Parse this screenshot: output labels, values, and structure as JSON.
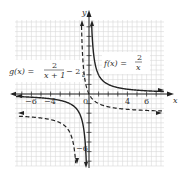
{
  "chart_data": {
    "type": "line",
    "title": "",
    "xlabel": "x",
    "ylabel": "y",
    "xlim": [
      -7.5,
      8
    ],
    "ylim": [
      -7.5,
      8
    ],
    "grid": true,
    "x_tick_labels": [
      "-6",
      "-4",
      "0",
      "4",
      "6"
    ],
    "y_tick_labels": [
      "2",
      "-6"
    ],
    "origin_label": "0",
    "series": [
      {
        "name": "f(x) = 2/x",
        "style": "solid",
        "formula": "2/x",
        "vertical_asymptote": 0,
        "horizontal_asymptote": 0
      },
      {
        "name": "g(x) = 2/(x+1) - 2",
        "style": "dashed",
        "formula": "2/(x+1)-2",
        "vertical_asymptote": -1,
        "horizontal_asymptote": -2
      }
    ],
    "annotations": [
      {
        "text": "f(x) = 2/x",
        "position": "upper right of y-axis"
      },
      {
        "text": "g(x) = 2/(x+1) − 2",
        "position": "upper left"
      }
    ]
  },
  "labels": {
    "x_axis": "x",
    "y_axis": "y",
    "f_lhs": "f(x) =",
    "f_num": "2",
    "f_den": "x",
    "g_lhs": "g(x) =",
    "g_num": "2",
    "g_den": "x + 1",
    "g_tail": "− 2",
    "tick_m6": "−6",
    "tick_m4": "−4",
    "tick_0": "0",
    "tick_4": "4",
    "tick_6": "6",
    "ytick_2": "2",
    "ytick_m6": "−6"
  }
}
